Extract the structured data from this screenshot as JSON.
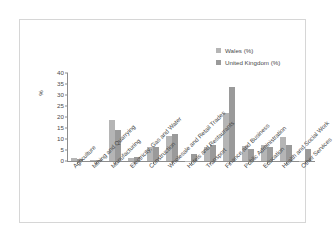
{
  "legend": {
    "position": "top-right",
    "entries": [
      {
        "label": "Wales (%)",
        "color": "#b5b5b5"
      },
      {
        "label": "United Kingdom (%)",
        "color": "#9a9a9a"
      }
    ]
  },
  "axis": {
    "ylabel": "%",
    "yticks": [
      "0",
      "5",
      "10",
      "15",
      "20",
      "25",
      "30",
      "35",
      "40"
    ]
  },
  "chart_data": {
    "type": "bar",
    "title": "",
    "subtitle": "",
    "xlabel": "",
    "ylabel": "%",
    "ylim": [
      0,
      40
    ],
    "ytick_step": 5,
    "grid": false,
    "legend_position": "top-right",
    "categories": [
      "Agriculture",
      "Mining and Quarrying",
      "Manufacturing",
      "Electricity, Gas and Water",
      "Construction",
      "Wholesale and Retail Trades",
      "Hotels and Restaurants",
      "Transport",
      "Finance and Business",
      "Public Administration",
      "Education",
      "Health and Social Work",
      "Other Services"
    ],
    "series": [
      {
        "name": "Wales (%)",
        "color": "#b5b5b5",
        "values": [
          1.4,
          0.3,
          18.5,
          1.5,
          6.2,
          11.5,
          0.2,
          6.3,
          21.7,
          6.7,
          7.5,
          10.8,
          0.2
        ]
      },
      {
        "name": "United Kingdom (%)",
        "color": "#9a9a9a",
        "values": [
          0.7,
          0.3,
          14.3,
          1.8,
          6.2,
          12.2,
          3.4,
          7.5,
          33.5,
          5.5,
          6.2,
          7.4,
          5.6
        ]
      }
    ]
  }
}
